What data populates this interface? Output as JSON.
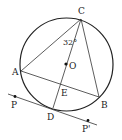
{
  "diagram": {
    "type": "geometry",
    "circle": {
      "center": "O",
      "cx": 66.5,
      "cy": 64.5,
      "r": 46.5
    },
    "points": {
      "C": {
        "label": "C",
        "x": 81,
        "y": 19
      },
      "A": {
        "label": "A",
        "x": 21,
        "y": 71
      },
      "B": {
        "label": "B",
        "x": 99,
        "y": 97
      },
      "D": {
        "label": "D",
        "x": 53,
        "y": 108
      },
      "E": {
        "label": "E",
        "x": 61,
        "y": 84
      },
      "O": {
        "label": "O",
        "x": 66,
        "y": 64
      },
      "P": {
        "label": "P",
        "x": 15,
        "y": 97
      },
      "P2": {
        "label": "P'",
        "x": 88,
        "y": 121
      }
    },
    "segments": [
      "CA",
      "CB",
      "CD",
      "AB"
    ],
    "tangent_line": {
      "from": [
        8,
        94
      ],
      "to": [
        97,
        125
      ],
      "through": "D"
    },
    "angle": {
      "vertex": "C",
      "between": [
        "CA",
        "CD"
      ],
      "label": "32°"
    }
  }
}
